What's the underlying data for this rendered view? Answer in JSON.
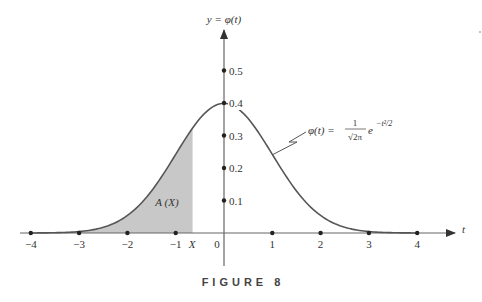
{
  "figure": {
    "caption": "FIGURE 8",
    "y_axis_label": "y = φ(t)",
    "x_axis_label": "t",
    "curve_label": "φ(t) =",
    "curve_label_fraction_num": "1",
    "curve_label_fraction_den": "√2π",
    "curve_label_exp_base": "e",
    "curve_label_exp": "−t²/2",
    "area_label": "A (X)",
    "marker_label": "X"
  },
  "colors": {
    "curve": "#555555",
    "axis": "#666666",
    "shade": "#c8c8c8",
    "text": "#333333"
  },
  "chart_data": {
    "type": "area",
    "title": "FIGURE 8",
    "xlabel": "t",
    "ylabel": "y = φ(t)",
    "x_ticks": [
      -4,
      -3,
      -2,
      -1,
      0,
      1,
      2,
      3,
      4
    ],
    "x_tick_labels": [
      "−4",
      "−3",
      "−2",
      "−1",
      "0",
      "1",
      "2",
      "3",
      "4"
    ],
    "y_ticks": [
      0.1,
      0.2,
      0.3,
      0.4,
      0.5
    ],
    "y_tick_labels": [
      "0.1",
      "0.2",
      "0.3",
      "0.4",
      "0.5"
    ],
    "xlim": [
      -4.2,
      4.8
    ],
    "ylim": [
      -0.1,
      0.7
    ],
    "grid": false,
    "shaded_region": {
      "from": -4,
      "to": -0.65,
      "label": "A (X)"
    },
    "X": -0.65,
    "series": [
      {
        "name": "φ(t)",
        "x": [
          -4,
          -3.5,
          -3,
          -2.5,
          -2,
          -1.5,
          -1,
          -0.5,
          0,
          0.5,
          1,
          1.5,
          2,
          2.5,
          3,
          3.5,
          4
        ],
        "values": [
          0.0001,
          0.0009,
          0.0044,
          0.0175,
          0.054,
          0.1295,
          0.242,
          0.3521,
          0.3989,
          0.3521,
          0.242,
          0.1295,
          0.054,
          0.0175,
          0.0044,
          0.0009,
          0.0001
        ]
      }
    ],
    "annotations": [
      "φ(t) = (1/√(2π)) e^(−t²/2)",
      "A (X)",
      "X"
    ]
  }
}
